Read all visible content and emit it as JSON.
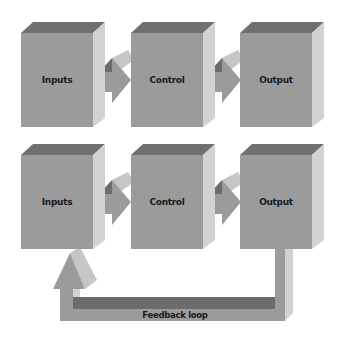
{
  "colors": {
    "front": "#9b9b9b",
    "top": "#707070",
    "side": "#d2d2d2",
    "loop_dark": "#6c6c6c",
    "text": "#1a1a1a"
  },
  "rows": [
    {
      "name": "open-loop",
      "boxes": [
        {
          "label": "Inputs"
        },
        {
          "label": "Control"
        },
        {
          "label": "Output"
        }
      ]
    },
    {
      "name": "closed-loop",
      "boxes": [
        {
          "label": "Inputs"
        },
        {
          "label": "Control"
        },
        {
          "label": "Output"
        }
      ]
    }
  ],
  "feedback": {
    "label": "Feedback loop"
  }
}
